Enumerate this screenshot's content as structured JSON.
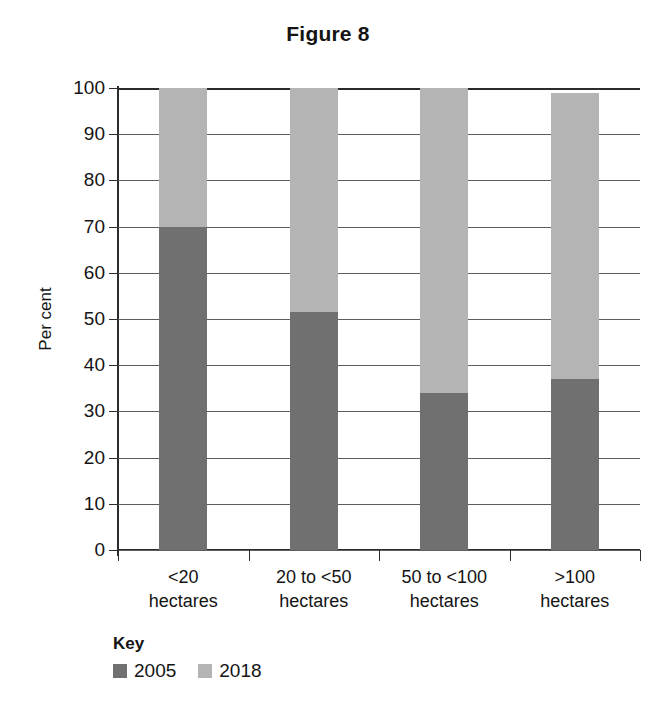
{
  "chart_data": {
    "type": "bar",
    "subtype": "stacked-100-percent",
    "title": "Figure 8",
    "xlabel": "",
    "ylabel": "Per cent",
    "ylim": [
      0,
      100
    ],
    "yticks": [
      0,
      10,
      20,
      30,
      40,
      50,
      60,
      70,
      80,
      90,
      100
    ],
    "ytick_labels": [
      "0",
      "10",
      "20",
      "30",
      "40",
      "50",
      "60",
      "70",
      "80",
      "90",
      "100"
    ],
    "grid": true,
    "grid_axis": "y",
    "legend_title": "Key",
    "legend_position": "bottom-left",
    "categories": [
      "<20 hectares",
      "20 to <50 hectares",
      "50 to <100 hectares",
      ">100 hectares"
    ],
    "category_lines": [
      [
        "<20",
        "hectares"
      ],
      [
        "20 to <50",
        "hectares"
      ],
      [
        "50 to <100",
        "hectares"
      ],
      [
        ">100",
        "hectares"
      ]
    ],
    "series": [
      {
        "name": "2005",
        "color": "#707070",
        "values": [
          70,
          51.5,
          34,
          37
        ]
      },
      {
        "name": "2018",
        "color": "#b4b4b4",
        "values": [
          30,
          48.5,
          66,
          62
        ]
      }
    ],
    "bar_totals": [
      100,
      100,
      100,
      99
    ]
  },
  "colors": {
    "background": "#ffffff",
    "text": "#141414",
    "axis": "#2b2b2b",
    "gridline": "#5d5d5d",
    "series_2005": "#707070",
    "series_2018": "#b4b4b4"
  }
}
